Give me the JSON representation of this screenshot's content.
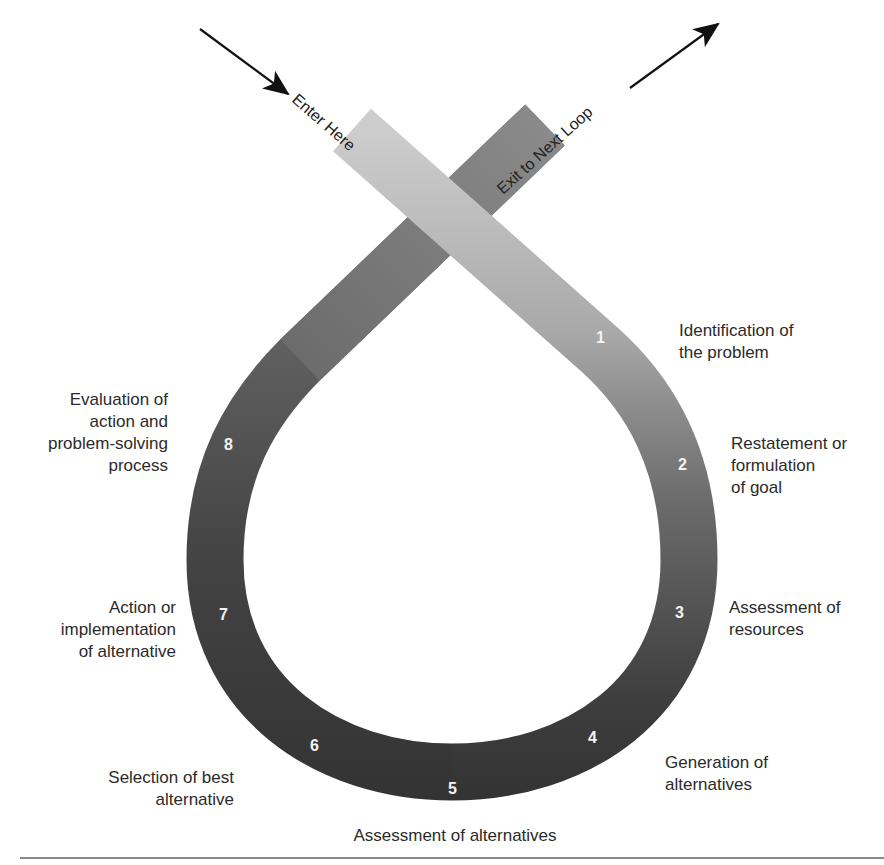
{
  "diagram": {
    "entry_label": "Enter Here",
    "exit_label": "Exit to Next Loop",
    "colors": {
      "entry_band": "#cfcfcf",
      "mid_band": "#8a8a8a",
      "dark_band": "#3c3c3c",
      "exit_band": "#7e7e7e",
      "number_text": "#f2f2f2",
      "label_text": "#2b2b2b",
      "arrow": "#111111"
    },
    "steps": [
      {
        "number": "1",
        "lines": [
          "Identification of",
          "the problem"
        ]
      },
      {
        "number": "2",
        "lines": [
          "Restatement or",
          "formulation",
          "of goal"
        ]
      },
      {
        "number": "3",
        "lines": [
          "Assessment of",
          "resources"
        ]
      },
      {
        "number": "4",
        "lines": [
          "Generation of",
          "alternatives"
        ]
      },
      {
        "number": "5",
        "lines": [
          "Assessment of alternatives"
        ]
      },
      {
        "number": "6",
        "lines": [
          "Selection of best",
          "alternative"
        ]
      },
      {
        "number": "7",
        "lines": [
          "Action or",
          "implementation",
          "of alternative"
        ]
      },
      {
        "number": "8",
        "lines": [
          "Evaluation of",
          "action and",
          "problem-solving",
          "process"
        ]
      }
    ]
  }
}
